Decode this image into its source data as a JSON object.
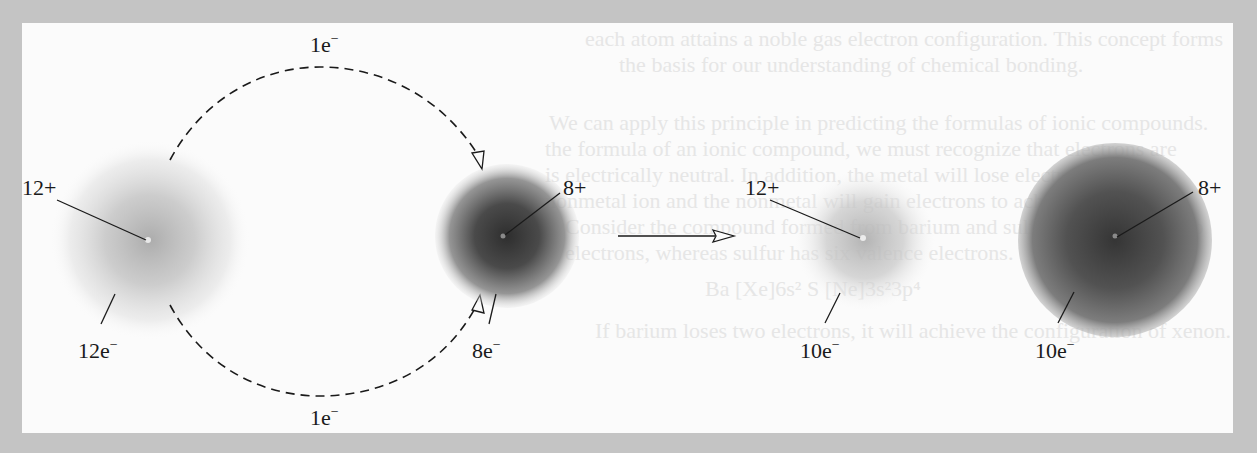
{
  "figure": {
    "colors": {
      "page_border": "#c4c4c4",
      "panel_background": "#fbfbfb",
      "ink": "#1a1a1a",
      "mg_cloud": "#9a9a9a",
      "o_cloud": "#3c3c3c"
    },
    "reactants": {
      "mg_atom": {
        "nucleus_charge": "12+",
        "electrons": "12e",
        "electrons_sup": "−"
      },
      "o_atom": {
        "nucleus_charge": "8+",
        "electrons": "8e",
        "electrons_sup": "−"
      }
    },
    "transfer": {
      "top_arc_label": "1e",
      "top_arc_label_sup": "−",
      "bottom_arc_label": "1e",
      "bottom_arc_label_sup": "−"
    },
    "reaction_arrow": {
      "icon": "right-arrow-icon"
    },
    "products": {
      "mg_ion": {
        "nucleus_charge": "12+",
        "electrons": "10e",
        "electrons_sup": "−"
      },
      "o_ion": {
        "nucleus_charge": "8+",
        "electrons": "10e",
        "electrons_sup": "−"
      }
    }
  },
  "background_bleed_text": [
    "each atom attains a noble gas electron configuration. This concept forms",
    "the basis for our understanding of chemical bonding.",
    "We can apply this principle in predicting the formulas of ionic compounds.",
    "the formula of an ionic compound, we must recognize that electrons are",
    "is electrically neutral. In addition, the metal will lose electrons and the",
    "nonmetal ion and the nonmetal will gain electrons to achieve a noble gas",
    "Consider the compound formed from barium and sulfur. Barium has two",
    "electrons, whereas sulfur has six valence electrons.",
    "Ba  [Xe]6s²     S  [Ne]3s²3p⁴",
    "If barium loses two electrons, it will achieve the configuration of xenon. By"
  ]
}
